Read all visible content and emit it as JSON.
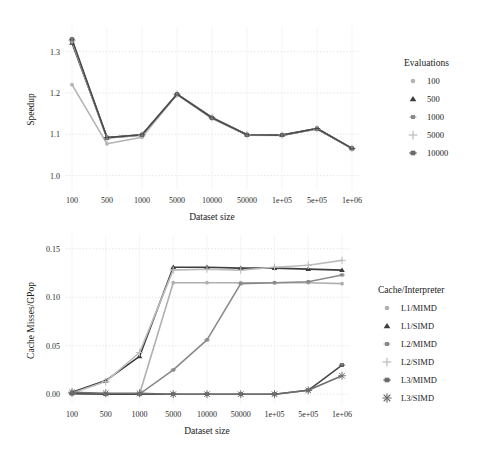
{
  "chart_data": [
    {
      "type": "line",
      "id": "speedup-chart",
      "title": "",
      "xlabel": "Dataset size",
      "ylabel": "Speedup",
      "categories": [
        "100",
        "500",
        "1000",
        "5000",
        "10000",
        "50000",
        "1e+05",
        "5e+05",
        "1e+06"
      ],
      "ylim": [
        0.975,
        1.345
      ],
      "yticks": [
        1.0,
        1.1,
        1.2,
        1.3
      ],
      "ytick_labels": [
        "1.0",
        "1.1",
        "1.2",
        "1.3"
      ],
      "grid": true,
      "legend_position": "right",
      "legend_title": "Evaluations",
      "series": [
        {
          "name": "100",
          "marker": "circle",
          "color": "#b3b3b3",
          "values": [
            1.22,
            1.077,
            1.093,
            1.196,
            1.138,
            1.098,
            1.097,
            1.113,
            1.066
          ]
        },
        {
          "name": "500",
          "marker": "triangle",
          "color": "#3d3d3d",
          "values": [
            1.321,
            1.092,
            1.099,
            1.197,
            1.141,
            1.099,
            1.098,
            1.114,
            1.066
          ]
        },
        {
          "name": "1000",
          "marker": "square",
          "color": "#8a8a8a",
          "values": [
            1.325,
            1.091,
            1.098,
            1.197,
            1.14,
            1.099,
            1.098,
            1.113,
            1.066
          ]
        },
        {
          "name": "5000",
          "marker": "plus",
          "color": "#bdbdbd",
          "values": [
            1.327,
            1.091,
            1.098,
            1.197,
            1.14,
            1.099,
            1.098,
            1.113,
            1.066
          ]
        },
        {
          "name": "10000",
          "marker": "square-dot",
          "color": "#4a4a4a",
          "values": [
            1.33,
            1.092,
            1.099,
            1.197,
            1.14,
            1.099,
            1.098,
            1.114,
            1.066
          ]
        }
      ]
    },
    {
      "type": "line",
      "id": "cache-misses-chart",
      "title": "",
      "xlabel": "Dataset size",
      "ylabel": "Cache Misses/GPop",
      "categories": [
        "100",
        "500",
        "1000",
        "5000",
        "10000",
        "50000",
        "1e+05",
        "5e+05",
        "1e+06"
      ],
      "ylim": [
        -0.006,
        0.158
      ],
      "yticks": [
        0.0,
        0.05,
        0.1,
        0.15
      ],
      "ytick_labels": [
        "0.00",
        "0.05",
        "0.10",
        "0.15"
      ],
      "grid": true,
      "legend_position": "right",
      "legend_title": "Cache/Interpreter",
      "series": [
        {
          "name": "L1/MIMD",
          "marker": "circle",
          "color": "#b0b0b0",
          "values": [
            0.001,
            0.0,
            0.0,
            0.115,
            0.115,
            0.115,
            0.115,
            0.115,
            0.114
          ]
        },
        {
          "name": "L1/SIMD",
          "marker": "triangle",
          "color": "#3d3d3d",
          "values": [
            0.002,
            0.014,
            0.039,
            0.131,
            0.131,
            0.13,
            0.13,
            0.129,
            0.128
          ]
        },
        {
          "name": "L2/MIMD",
          "marker": "square",
          "color": "#8a8a8a",
          "values": [
            0.0,
            0.0,
            0.0,
            0.025,
            0.056,
            0.114,
            0.115,
            0.116,
            0.123
          ]
        },
        {
          "name": "L2/SIMD",
          "marker": "plus",
          "color": "#bdbdbd",
          "values": [
            0.001,
            0.013,
            0.043,
            0.128,
            0.129,
            0.128,
            0.131,
            0.133,
            0.138
          ]
        },
        {
          "name": "L3/MIMD",
          "marker": "square-dot",
          "color": "#4a4a4a",
          "values": [
            0.001,
            0.0,
            0.0,
            0.0,
            0.0,
            0.0,
            0.0,
            0.004,
            0.03
          ]
        },
        {
          "name": "L3/SIMD",
          "marker": "asterisk",
          "color": "#6e6e6e",
          "values": [
            0.002,
            0.001,
            0.001,
            0.0,
            0.0,
            0.0,
            0.0,
            0.004,
            0.019
          ]
        }
      ]
    }
  ]
}
